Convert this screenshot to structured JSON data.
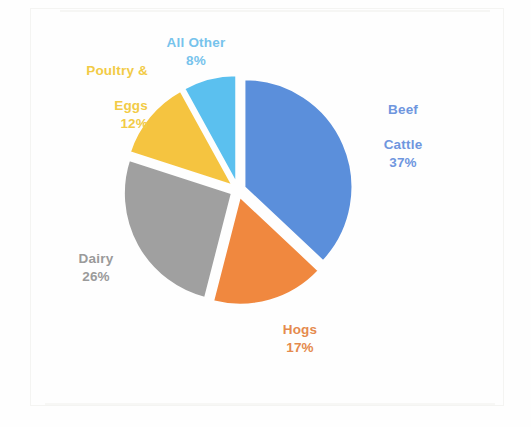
{
  "chart_data": {
    "type": "pie",
    "title": "",
    "subtitle": "",
    "xlabel": "",
    "ylabel": "",
    "legend_position": "none",
    "grid": false,
    "exploded": true,
    "start_angle_deg": 0,
    "direction": "clockwise",
    "categories": [
      "Beef Cattle",
      "Hogs",
      "Dairy",
      "Poultry & Eggs",
      "All Other"
    ],
    "values": [
      37,
      17,
      26,
      12,
      8
    ],
    "value_unit": "%",
    "slices": [
      {
        "name": "Beef Cattle",
        "label_text": "Beef\nCattle",
        "label_line1": "Beef",
        "label_line2": "Cattle",
        "value": 37,
        "value_text": "37%",
        "color": "#5b8fdb",
        "label_color": "#6f96de"
      },
      {
        "name": "Hogs",
        "label_text": "Hogs",
        "label_line1": "Hogs",
        "label_line2": "",
        "value": 17,
        "value_text": "17%",
        "color": "#f0883f",
        "label_color": "#e58a4d"
      },
      {
        "name": "Dairy",
        "label_text": "Dairy",
        "label_line1": "Dairy",
        "label_line2": "",
        "value": 26,
        "value_text": "26%",
        "color": "#a0a0a0",
        "label_color": "#9a9a9a"
      },
      {
        "name": "Poultry & Eggs",
        "label_text": "Poultry &\nEggs",
        "label_line1": "Poultry &",
        "label_line2": "Eggs",
        "value": 12,
        "value_text": "12%",
        "color": "#f5c440",
        "label_color": "#f2cb46"
      },
      {
        "name": "All Other",
        "label_text": "All Other",
        "label_line1": "All Other",
        "label_line2": "",
        "value": 8,
        "value_text": "8%",
        "color": "#5bc0ef",
        "label_color": "#77c3ec"
      }
    ],
    "colors": {
      "beef_cattle": "#5b8fdb",
      "hogs": "#f0883f",
      "dairy": "#a0a0a0",
      "poultry_eggs": "#f5c440",
      "all_other": "#5bc0ef",
      "background": "#fefefe"
    }
  },
  "geometry": {
    "center_x": 238,
    "center_y": 190,
    "radius": 108,
    "explode_offset": 7
  }
}
